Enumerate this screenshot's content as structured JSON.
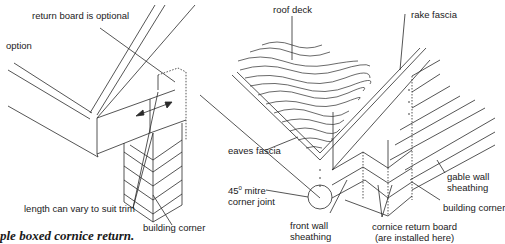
{
  "figure_left": {
    "labels": {
      "return_board": "return board is optional",
      "option": "option",
      "length": "length can vary to suit trim",
      "building_corner": "building corner"
    },
    "caption": "ple boxed cornice return."
  },
  "figure_right": {
    "labels": {
      "roof_deck": "roof deck",
      "rake_fascia": "rake fascia",
      "eaves_fascia": "eaves fascia",
      "mitre_line1_prefix": "45",
      "mitre_degree": "0",
      "mitre_line1_suffix": " mitre",
      "mitre_line2": "corner joint",
      "front_wall_line1": "front wall",
      "front_wall_line2": "sheathing",
      "cornice_line1": "cornice return board",
      "cornice_line2": "(are installed here)",
      "gable_line1": "gable wall",
      "gable_line2": "sheathing",
      "building_corner": "building corner"
    }
  }
}
